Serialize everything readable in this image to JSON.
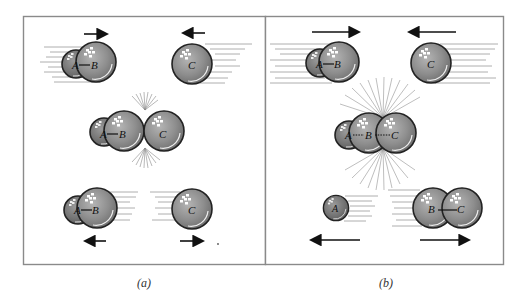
{
  "figure": {
    "panels": [
      {
        "id": "a",
        "caption": "(a)",
        "description": "Nonreactive collision: A–B molecule and atom C collide and rebound unchanged",
        "before": {
          "molecule_label_1": "A",
          "molecule_label_2": "B",
          "atom_label": "C"
        },
        "during": {
          "labels": [
            "A",
            "B",
            "C"
          ]
        },
        "after": {
          "molecule_label_1": "A",
          "molecule_label_2": "B",
          "atom_label": "C"
        }
      },
      {
        "id": "b",
        "caption": "(b)",
        "description": "Reactive collision: A–B + C forms A···B···C complex, products A + B–C",
        "before": {
          "molecule_label_1": "A",
          "molecule_label_2": "B",
          "atom_label": "C"
        },
        "during": {
          "labels": [
            "A",
            "B",
            "C"
          ]
        },
        "after": {
          "atom_label": "A",
          "molecule_label_1": "B",
          "molecule_label_2": "C"
        }
      }
    ],
    "colors": {
      "sphere_fill": "#8e8e8e",
      "sphere_small_fill": "#7a7a7a",
      "sphere_outline": "#222222",
      "highlight": "#ffffff",
      "frame": "#8a8a8a",
      "arrow": "#111111",
      "speed_lines": "#9a9a9a"
    }
  }
}
